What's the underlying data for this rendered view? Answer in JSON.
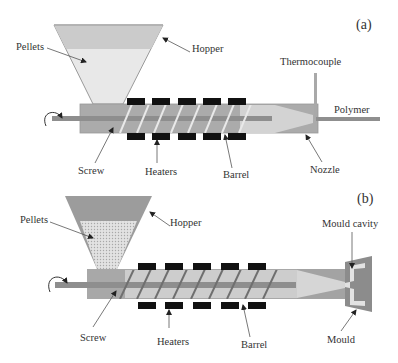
{
  "figure": {
    "colors": {
      "hopper_top": "#c9c9c9",
      "hopper_fill_a": "#e6e6e6",
      "hopper_b": "#9b9b9b",
      "pellet_fill_b": "#dcdcdc",
      "barrel": "#ababab",
      "barrel_interior": "#c8c8c8",
      "screw": "#8e8e8e",
      "flight": "#e8e8e8",
      "flight_b": "#6f6f6f",
      "heater": "#111111",
      "nozzle": "#a3a3a3",
      "nozzle_cone": "#d6d6d6",
      "mould": "#8a8a8a",
      "cavity": "#e4e4e4",
      "leader": "#444444",
      "text": "#333333"
    },
    "panel_a": {
      "panel_label": "(a)",
      "labels": {
        "pellets": "Pellets",
        "hopper": "Hopper",
        "thermocouple": "Thermocouple",
        "polymer": "Polymer",
        "screw": "Screw",
        "heaters": "Heaters",
        "barrel": "Barrel",
        "nozzle": "Nozzle"
      }
    },
    "panel_b": {
      "panel_label": "(b)",
      "labels": {
        "pellets": "Pellets",
        "hopper": "Hopper",
        "mould_cavity": "Mould cavity",
        "screw": "Screw",
        "heaters": "Heaters",
        "barrel": "Barrel",
        "mould": "Mould"
      }
    }
  }
}
